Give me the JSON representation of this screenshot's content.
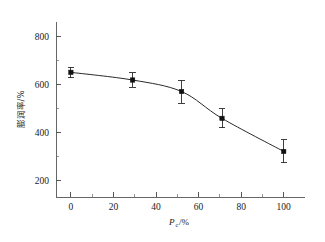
{
  "chart_data": {
    "type": "line",
    "title": "",
    "subtitle": "",
    "xlabel": "Pc/%",
    "xlabel_base": "P",
    "xlabel_sub": "c",
    "xlabel_unit": "/%",
    "ylabel": "膨润率/%",
    "x": [
      0,
      29,
      52,
      71,
      100
    ],
    "values": [
      650,
      618,
      570,
      458,
      320
    ],
    "yerr_upper": [
      22,
      30,
      48,
      40,
      48
    ],
    "yerr_lower": [
      22,
      30,
      48,
      40,
      48
    ],
    "xlim": [
      -7,
      110
    ],
    "ylim": [
      130,
      860
    ],
    "xticks": [
      0,
      20,
      40,
      60,
      80,
      100
    ],
    "xtick_labels": [
      "0",
      "20",
      "40",
      "60",
      "80",
      "100"
    ],
    "xminor_ticks": [
      10,
      30,
      50,
      70,
      90
    ],
    "yticks": [
      200,
      400,
      600,
      800
    ],
    "ytick_labels": [
      "200",
      "400",
      "600",
      "800"
    ],
    "yminor_ticks": [
      300,
      500,
      700
    ],
    "grid": false,
    "legend": null,
    "marker": "square",
    "marker_color": "#111111",
    "line_color": "#2a2a2a",
    "background_color": "#ffffff",
    "series": [
      {
        "name": "膨润率",
        "values": [
          650,
          618,
          570,
          458,
          320
        ]
      }
    ]
  }
}
